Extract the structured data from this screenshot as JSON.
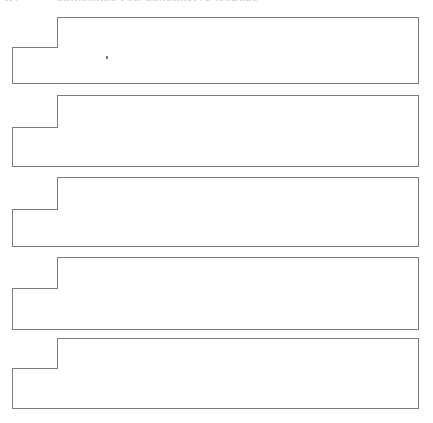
{
  "page": {
    "width": 433,
    "height": 423,
    "background_color": "#ffffff",
    "kind": "scanned-book-page"
  },
  "header": {
    "folio": "114",
    "running_head": "Grammars for Generative Models",
    "text_color": "#bcbcc0",
    "clipped": "true"
  },
  "figure_style": {
    "stroke_color": "#7c7c80",
    "stroke_width": 1,
    "fill_color": "#ffffff"
  },
  "figures": [
    {
      "label": "notched-rectangle-1",
      "notch_x": 57,
      "left": 12,
      "right": 418,
      "top": 17,
      "step_y": 47,
      "bottom": 83
    },
    {
      "label": "notched-rectangle-2",
      "notch_x": 57,
      "left": 12,
      "right": 418,
      "top": 95,
      "step_y": 127,
      "bottom": 166
    },
    {
      "label": "notched-rectangle-3",
      "notch_x": 57,
      "left": 12,
      "right": 418,
      "top": 177,
      "step_y": 209,
      "bottom": 246
    },
    {
      "label": "notched-rectangle-4",
      "notch_x": 57,
      "left": 12,
      "right": 418,
      "top": 257,
      "step_y": 288,
      "bottom": 329
    },
    {
      "label": "notched-rectangle-5",
      "notch_x": 57,
      "left": 12,
      "right": 418,
      "top": 338,
      "step_y": 368,
      "bottom": 408
    }
  ],
  "artifacts": [
    {
      "label": "ink-speck",
      "x": 106,
      "y": 56
    }
  ]
}
